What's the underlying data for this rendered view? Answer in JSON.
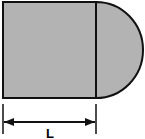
{
  "diagram": {
    "shape": "square with semicircle attached on right side",
    "fill_color": "#b3b3b3",
    "stroke_color": "#111111",
    "dimension": {
      "label": "L",
      "spans": "width of square"
    }
  }
}
